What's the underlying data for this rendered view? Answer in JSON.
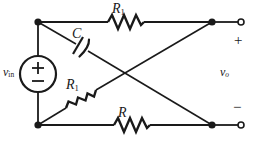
{
  "figure": {
    "type": "electrical-circuit-diagram",
    "stroke_color": "#1a1a1a",
    "background_color": "#ffffff"
  },
  "labels": {
    "r1_top": "R",
    "r1_top_sub": "1",
    "capacitor": "C",
    "r1_diagonal": "R",
    "r1_diagonal_sub": "1",
    "r_bottom": "R",
    "source": "v",
    "source_sub": "in",
    "output": "v",
    "output_sub": "o",
    "output_plus": "+",
    "output_minus": "−"
  },
  "source_symbol": {
    "plus": "+",
    "minus": "−"
  },
  "components": [
    {
      "name": "resistor-r1-top",
      "label": "R1",
      "edge": "top-left-node to top-right-node"
    },
    {
      "name": "capacitor-c",
      "label": "C",
      "edge": "top-left-node to bottom-right-node"
    },
    {
      "name": "resistor-r1-diagonal",
      "label": "R1",
      "edge": "bottom-left-node to top-right-node"
    },
    {
      "name": "resistor-r-bottom",
      "label": "R",
      "edge": "bottom-left-node to bottom-right-node"
    },
    {
      "name": "voltage-source-vin",
      "label": "vin",
      "edge": "top-left-node to bottom-left-node"
    }
  ],
  "terminals": [
    {
      "name": "output-terminal-positive",
      "polarity": "+"
    },
    {
      "name": "output-terminal-negative",
      "polarity": "−"
    }
  ]
}
